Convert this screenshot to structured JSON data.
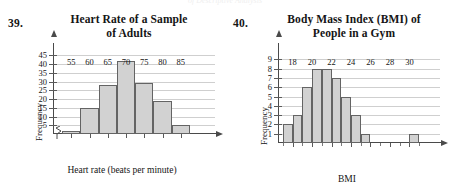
{
  "page": {
    "running_head": "of Descriptive Analysis"
  },
  "problems": [
    {
      "number": "39.",
      "title_line1": "Heart Rate of a Sample",
      "title_line2": "of Adults"
    },
    {
      "number": "40.",
      "title_line1": "Body Mass Index (BMI) of",
      "title_line2": "People in a Gym"
    }
  ],
  "chart_data": [
    {
      "type": "bar",
      "title": "Heart Rate of a Sample of Adults",
      "xlabel": "Heart rate (beats per minute)",
      "ylabel": "Frequency",
      "categories": [
        "52.5-57.5",
        "57.5-62.5",
        "62.5-67.5",
        "67.5-72.5",
        "72.5-77.5",
        "77.5-82.5",
        "82.5-87.5"
      ],
      "bin_edges": [
        52.5,
        57.5,
        62.5,
        67.5,
        72.5,
        77.5,
        82.5,
        87.5
      ],
      "values": [
        2,
        15,
        28,
        42,
        29,
        19,
        5
      ],
      "xlim": [
        50,
        90
      ],
      "ylim": [
        0,
        47
      ],
      "x_ticks": [
        55,
        60,
        65,
        70,
        75,
        80,
        85
      ],
      "x_tick_labels": [
        "55",
        "60",
        "65",
        "70",
        "75",
        "80",
        "85"
      ],
      "y_ticks": [
        5,
        10,
        15,
        20,
        25,
        30,
        35,
        40,
        45
      ],
      "y_tick_labels": [
        "5",
        "10",
        "15",
        "20",
        "25",
        "30",
        "35",
        "40",
        "45"
      ],
      "grid": true,
      "legend": "none",
      "axis_break_x": true,
      "bar_fill": "#d2d2d2",
      "bar_stroke": "#646464"
    },
    {
      "type": "bar",
      "title": "Body Mass Index (BMI) of People in a Gym",
      "xlabel": "BMI",
      "ylabel": "Frequency",
      "categories": [
        "17-18",
        "18-19",
        "19-20",
        "20-21",
        "21-22",
        "22-23",
        "23-24",
        "24-25",
        "25-26",
        "26-27",
        "27-28",
        "28-29",
        "29-30",
        "30-31"
      ],
      "bin_edges": [
        17,
        18,
        19,
        20,
        21,
        22,
        23,
        24,
        25,
        26,
        27,
        28,
        29,
        30,
        31
      ],
      "values": [
        2,
        3,
        6,
        8,
        8,
        7,
        5,
        3,
        1,
        0,
        0,
        0,
        0,
        1
      ],
      "xlim": [
        16.5,
        31.5
      ],
      "ylim": [
        0,
        9.8
      ],
      "x_ticks": [
        18,
        20,
        22,
        24,
        26,
        28,
        30
      ],
      "x_tick_labels": [
        "18",
        "20",
        "22",
        "24",
        "26",
        "28",
        "30"
      ],
      "x_minor_ticks": [
        17,
        19,
        21,
        23,
        25,
        27,
        29,
        31
      ],
      "y_ticks": [
        1,
        2,
        3,
        4,
        5,
        6,
        7,
        8,
        9
      ],
      "y_tick_labels": [
        "1",
        "2",
        "3",
        "4",
        "5",
        "6",
        "7",
        "8",
        "9"
      ],
      "grid": true,
      "legend": "none",
      "axis_break_x": false,
      "bar_fill": "#d2d2d2",
      "bar_stroke": "#646464"
    }
  ]
}
